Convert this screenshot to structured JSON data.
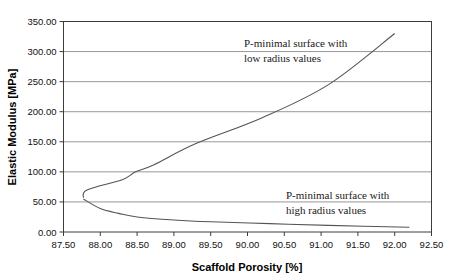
{
  "chart_data": {
    "type": "line",
    "title": "",
    "xlabel": "Scaffold Porosity [%]",
    "ylabel": "Elastic Modulus [MPa]",
    "xlim": [
      87.5,
      92.5
    ],
    "ylim": [
      0.0,
      350.0
    ],
    "xticks": [
      "87.50",
      "88.00",
      "88.50",
      "89.00",
      "89.50",
      "90.00",
      "90.50",
      "91.00",
      "91.50",
      "92.00",
      "92.50"
    ],
    "yticks": [
      "0.00",
      "50.00",
      "100.00",
      "150.00",
      "200.00",
      "250.00",
      "300.00",
      "350.00"
    ],
    "grid": "horizontal",
    "legend_position": "inline-annotations",
    "marker": "diamond",
    "series": [
      {
        "name": "P-minimal surface with low radius values",
        "annotation_lines": [
          "P-minimal surface with",
          "low radius values"
        ],
        "x": [
          87.77,
          87.82,
          88.3,
          88.48,
          88.73,
          89.3,
          90.2,
          91.1,
          92.0
        ],
        "y": [
          57.0,
          70.0,
          87.0,
          100.0,
          112.0,
          147.0,
          190.0,
          245.0,
          330.0
        ]
      },
      {
        "name": "P-minimal surface with high radius values",
        "annotation_lines": [
          "P-minimal surface with",
          "high radius values"
        ],
        "x": [
          87.77,
          88.0,
          88.25,
          88.5,
          89.0,
          89.5,
          90.3,
          91.1,
          92.2
        ],
        "y": [
          55.0,
          39.0,
          31.0,
          25.0,
          20.0,
          17.0,
          14.0,
          11.0,
          8.0
        ]
      }
    ]
  },
  "axes": {
    "y_axis_title": "Elastic Modulus [MPa]",
    "x_axis_title": "Scaffold Porosity [%]"
  },
  "annotations": {
    "upper": {
      "line1": "P-minimal surface with",
      "line2": "low radius values"
    },
    "lower": {
      "line1": "P-minimal surface with",
      "line2": "high radius values"
    }
  },
  "colors": {
    "line": "#545454",
    "marker": "#2b2b2b",
    "grid": "#7d7d7d",
    "frame": "#3c3c3c",
    "background": "#ffffff"
  }
}
